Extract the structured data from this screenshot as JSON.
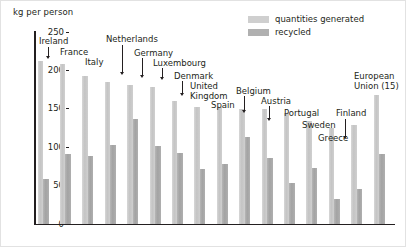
{
  "axis": {
    "unit_label": "kg per person",
    "y_ticks": [
      250,
      200,
      150,
      100,
      50,
      0
    ]
  },
  "legend": {
    "position": "top-right",
    "items": [
      {
        "label": "quantities generated",
        "swatch": "generated",
        "color": "#cfcfcf"
      },
      {
        "label": "recycled",
        "swatch": "recycled",
        "color": "#b0b0b0"
      }
    ]
  },
  "colors": {
    "generated": "#cfcfcf",
    "recycled": "#b0b0b0",
    "axis": "#231f20",
    "frame": "#e2e2e2",
    "background": "#ffffff"
  },
  "chart_data": {
    "type": "bar",
    "title": "",
    "subtitle": "",
    "xlabel": "",
    "ylabel": "kg per person",
    "ylim": [
      0,
      250
    ],
    "yticks": [
      0,
      50,
      100,
      150,
      200,
      250
    ],
    "grid": false,
    "legend_position": "top-right",
    "categories": [
      "Ireland",
      "France",
      "Italy",
      "Netherlands",
      "Germany",
      "Luxembourg",
      "Denmark",
      "United Kingdom",
      "Spain",
      "Belgium",
      "Austria",
      "Portugal",
      "Sweden",
      "Greece",
      "Finland",
      "European Union (15)"
    ],
    "series": [
      {
        "name": "quantities generated",
        "color": "#cfcfcf",
        "values": [
          212,
          208,
          193,
          185,
          181,
          179,
          160,
          153,
          152,
          150,
          150,
          145,
          134,
          125,
          129,
          168
        ]
      },
      {
        "name": "recycled",
        "color": "#b0b0b0",
        "values": [
          58,
          91,
          89,
          103,
          137,
          101,
          92,
          71,
          78,
          113,
          86,
          53,
          73,
          33,
          45,
          91
        ]
      }
    ]
  },
  "callouts": [
    {
      "label": "Ireland",
      "x": 38,
      "y": 36,
      "leader_x": 47,
      "leader_top": 46,
      "leader_h": 9,
      "type": "arrow"
    },
    {
      "label": "France",
      "x": 59,
      "y": 47,
      "leader_x": 0,
      "leader_top": 0,
      "leader_h": 0,
      "type": "none"
    },
    {
      "label": "Italy",
      "x": 84,
      "y": 57,
      "leader_x": 0,
      "leader_top": 0,
      "leader_h": 0,
      "type": "none"
    },
    {
      "label": "Netherlands",
      "x": 105,
      "y": 34,
      "leader_x": 121,
      "leader_top": 44,
      "leader_h": 27,
      "type": "arrow"
    },
    {
      "label": "Germany",
      "x": 133,
      "y": 48,
      "leader_x": 141,
      "leader_top": 57,
      "leader_h": 17,
      "type": "arrow"
    },
    {
      "label": "Luxembourg",
      "x": 152,
      "y": 58,
      "leader_x": 161,
      "leader_top": 67,
      "leader_h": 9,
      "type": "arrow"
    },
    {
      "label": "Denmark",
      "x": 173,
      "y": 71,
      "leader_x": 181,
      "leader_top": 80,
      "leader_h": 12,
      "type": "arrow"
    },
    {
      "label": "United\nKingdom",
      "x": 189,
      "y": 81,
      "leader_x": 0,
      "leader_top": 0,
      "leader_h": 0,
      "type": "none"
    },
    {
      "label": "Spain",
      "x": 210,
      "y": 100,
      "leader_x": 0,
      "leader_top": 0,
      "leader_h": 0,
      "type": "none"
    },
    {
      "label": "Belgium",
      "x": 235,
      "y": 86,
      "leader_x": 243,
      "leader_top": 95,
      "leader_h": 14,
      "type": "arrow"
    },
    {
      "label": "Austria",
      "x": 260,
      "y": 96,
      "leader_x": 268,
      "leader_top": 105,
      "leader_h": 12,
      "type": "arrow"
    },
    {
      "label": "Portugal",
      "x": 283,
      "y": 108,
      "leader_x": 0,
      "leader_top": 0,
      "leader_h": 0,
      "type": "none"
    },
    {
      "label": "Sweden",
      "x": 301,
      "y": 120,
      "leader_x": 0,
      "leader_top": 0,
      "leader_h": 0,
      "type": "none"
    },
    {
      "label": "Greece",
      "x": 317,
      "y": 133,
      "leader_x": 0,
      "leader_top": 0,
      "leader_h": 0,
      "type": "none"
    },
    {
      "label": "Finland",
      "x": 335,
      "y": 108,
      "leader_x": 344,
      "leader_top": 118,
      "leader_h": 17,
      "type": "arrow"
    },
    {
      "label": "European\nUnion (15)",
      "x": 353,
      "y": 71,
      "leader_x": 0,
      "leader_top": 0,
      "leader_h": 0,
      "type": "none"
    }
  ]
}
